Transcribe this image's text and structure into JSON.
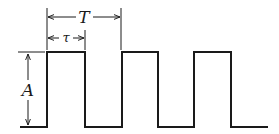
{
  "diagram": {
    "type": "pulse-train",
    "labels": {
      "period": "T",
      "pulse_width": "τ",
      "amplitude": "A"
    },
    "colors": {
      "stroke": "#1a1a1a",
      "background": "#ffffff"
    },
    "pulses": 3
  }
}
